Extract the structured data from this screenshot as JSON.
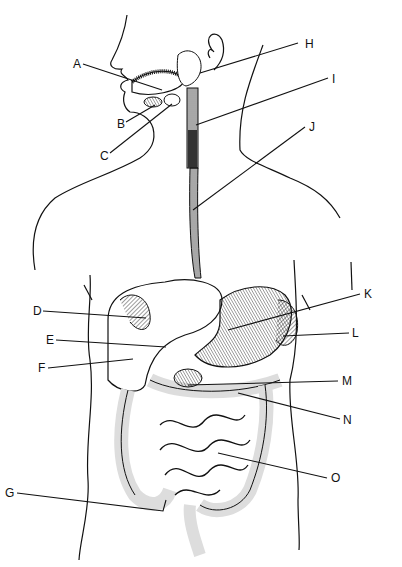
{
  "diagram": {
    "labels": [
      {
        "id": "A",
        "x": 73,
        "y": 58
      },
      {
        "id": "B",
        "x": 117,
        "y": 118
      },
      {
        "id": "C",
        "x": 100,
        "y": 150
      },
      {
        "id": "H",
        "x": 305,
        "y": 38
      },
      {
        "id": "I",
        "x": 332,
        "y": 73
      },
      {
        "id": "J",
        "x": 309,
        "y": 121
      },
      {
        "id": "D",
        "x": 33,
        "y": 305
      },
      {
        "id": "E",
        "x": 46,
        "y": 334
      },
      {
        "id": "F",
        "x": 38,
        "y": 362
      },
      {
        "id": "K",
        "x": 364,
        "y": 288
      },
      {
        "id": "L",
        "x": 352,
        "y": 327
      },
      {
        "id": "M",
        "x": 342,
        "y": 375
      },
      {
        "id": "N",
        "x": 343,
        "y": 414
      },
      {
        "id": "O",
        "x": 331,
        "y": 472
      },
      {
        "id": "G",
        "x": 5,
        "y": 487
      }
    ]
  }
}
